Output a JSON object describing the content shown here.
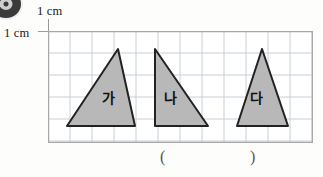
{
  "page": {
    "background_color": "#fdfdfc"
  },
  "corner_badge": {
    "icon": "filled-circle-badge-icon",
    "color": "#3a3a3a"
  },
  "labels": {
    "top_unit": "1 cm",
    "left_unit": "1 cm"
  },
  "grid": {
    "cell_size_px": 22,
    "columns": 12,
    "rows": 5,
    "line_color": "#c9cfd6",
    "border_color": "#a8a8a8",
    "background_color": "#ffffff",
    "width_px": 265,
    "height_px": 112
  },
  "figures": {
    "fill_color": "#b8b8b8",
    "stroke_color": "#222222",
    "items": [
      {
        "label": "가",
        "shape": "triangle",
        "points": "19,95 70,18 87,95",
        "label_x": 60,
        "label_y": 72,
        "base_cm": 3,
        "height_cm": 3.5
      },
      {
        "label": "나",
        "shape": "right-triangle",
        "points": "107,18 107,95 160,95",
        "label_x": 122,
        "label_y": 72,
        "base_cm": 2.5,
        "height_cm": 3.5
      },
      {
        "label": "다",
        "shape": "isosceles-triangle",
        "points": "214,18 189,95 240,95",
        "label_x": 208,
        "label_y": 72,
        "base_cm": 2.5,
        "height_cm": 3.5
      }
    ]
  },
  "answer": {
    "open_paren": "(",
    "close_paren": ")"
  }
}
